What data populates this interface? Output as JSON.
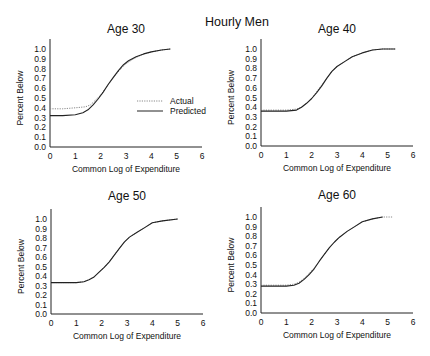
{
  "figure": {
    "suptitle": "Hourly Men",
    "legend": {
      "actual_label": "Actual",
      "predicted_label": "Predicted"
    }
  },
  "chart_data": [
    {
      "type": "line",
      "title": "Age 30",
      "xlabel": "Common Log of Expenditure",
      "ylabel": "Percent Below",
      "xlim": [
        0,
        6
      ],
      "ylim": [
        0,
        1.0
      ],
      "xticks": [
        "0",
        "1",
        "2",
        "3",
        "4",
        "5",
        "6"
      ],
      "yticks": [
        "0.0",
        "0.1",
        "0.2",
        "0.3",
        "0.4",
        "0.5",
        "0.6",
        "0.7",
        "0.8",
        "0.9",
        "1.0"
      ],
      "grid": false,
      "legend_position": "inside right-middle",
      "series": [
        {
          "name": "Actual",
          "style": "dotted",
          "x": [
            0,
            0.5,
            1.0,
            1.4,
            1.6,
            1.8,
            2.0,
            2.2,
            2.4,
            2.6,
            2.8,
            3.0,
            3.3,
            3.6,
            4.0,
            4.4,
            4.75
          ],
          "y": [
            0.39,
            0.39,
            0.4,
            0.41,
            0.43,
            0.48,
            0.53,
            0.6,
            0.67,
            0.74,
            0.8,
            0.85,
            0.9,
            0.94,
            0.97,
            0.99,
            1.0
          ]
        },
        {
          "name": "Predicted",
          "style": "solid",
          "x": [
            0,
            0.5,
            1.0,
            1.3,
            1.5,
            1.7,
            1.9,
            2.1,
            2.3,
            2.5,
            2.7,
            2.9,
            3.1,
            3.4,
            3.7,
            4.0,
            4.4,
            4.75
          ],
          "y": [
            0.32,
            0.32,
            0.33,
            0.35,
            0.38,
            0.43,
            0.49,
            0.56,
            0.64,
            0.71,
            0.78,
            0.84,
            0.88,
            0.92,
            0.95,
            0.97,
            0.99,
            1.0
          ]
        }
      ]
    },
    {
      "type": "line",
      "title": "Age 40",
      "xlabel": "Common Log of Expenditure",
      "ylabel": "Percent Below",
      "xlim": [
        0,
        6
      ],
      "ylim": [
        0,
        1.0
      ],
      "xticks": [
        "0",
        "1",
        "2",
        "3",
        "4",
        "5",
        "6"
      ],
      "yticks": [
        "0.0",
        "0.1",
        "0.2",
        "0.3",
        "0.4",
        "0.5",
        "0.6",
        "0.7",
        "0.8",
        "0.9",
        "1.0"
      ],
      "grid": false,
      "series": [
        {
          "name": "Actual",
          "style": "dotted",
          "x": [
            0,
            0.5,
            1.0,
            1.4,
            1.6,
            1.8,
            2.0,
            2.2,
            2.4,
            2.6,
            2.8,
            3.0,
            3.3,
            3.6,
            4.0,
            4.4,
            4.8,
            5.3
          ],
          "y": [
            0.37,
            0.37,
            0.37,
            0.38,
            0.4,
            0.44,
            0.49,
            0.56,
            0.63,
            0.7,
            0.77,
            0.82,
            0.87,
            0.92,
            0.96,
            0.99,
            1.0,
            1.0
          ]
        },
        {
          "name": "Predicted",
          "style": "solid",
          "x": [
            0,
            0.5,
            1.0,
            1.4,
            1.6,
            1.8,
            2.0,
            2.2,
            2.4,
            2.6,
            2.8,
            3.0,
            3.3,
            3.6,
            4.0,
            4.4,
            4.8,
            5.3
          ],
          "y": [
            0.36,
            0.36,
            0.36,
            0.37,
            0.4,
            0.44,
            0.49,
            0.55,
            0.62,
            0.7,
            0.77,
            0.82,
            0.87,
            0.92,
            0.96,
            0.99,
            1.0,
            1.0
          ]
        }
      ]
    },
    {
      "type": "line",
      "title": "Age 50",
      "xlabel": "Common Log of Expenditure",
      "ylabel": "Percent Below",
      "xlim": [
        0,
        6
      ],
      "ylim": [
        0,
        1.0
      ],
      "xticks": [
        "0",
        "1",
        "2",
        "3",
        "4",
        "5",
        "6"
      ],
      "yticks": [
        "0.0",
        "0.1",
        "0.2",
        "0.3",
        "0.4",
        "0.5",
        "0.6",
        "0.7",
        "0.8",
        "0.9",
        "1.0"
      ],
      "grid": false,
      "series": [
        {
          "name": "Actual",
          "style": "dotted",
          "x": [
            0,
            0.5,
            1.0,
            1.3,
            1.5,
            1.7,
            1.9,
            2.1,
            2.3,
            2.5,
            2.7,
            2.9,
            3.1,
            3.4,
            3.7,
            4.0,
            4.4,
            5.0
          ],
          "y": [
            0.33,
            0.33,
            0.33,
            0.34,
            0.36,
            0.39,
            0.44,
            0.49,
            0.55,
            0.62,
            0.69,
            0.76,
            0.81,
            0.86,
            0.91,
            0.96,
            0.98,
            1.0
          ]
        },
        {
          "name": "Predicted",
          "style": "solid",
          "x": [
            0,
            0.5,
            1.0,
            1.3,
            1.5,
            1.7,
            1.9,
            2.1,
            2.3,
            2.5,
            2.7,
            2.9,
            3.1,
            3.4,
            3.7,
            4.0,
            4.4,
            5.0
          ],
          "y": [
            0.33,
            0.33,
            0.33,
            0.34,
            0.36,
            0.39,
            0.44,
            0.49,
            0.55,
            0.62,
            0.69,
            0.76,
            0.81,
            0.86,
            0.91,
            0.96,
            0.98,
            1.0
          ]
        }
      ]
    },
    {
      "type": "line",
      "title": "Age 60",
      "xlabel": "Common Log of Expenditure",
      "ylabel": "Percent Below",
      "xlim": [
        0,
        6
      ],
      "ylim": [
        0,
        1.0
      ],
      "xticks": [
        "0",
        "1",
        "2",
        "3",
        "4",
        "5",
        "6"
      ],
      "yticks": [
        "0.0",
        "0.1",
        "0.2",
        "0.3",
        "0.4",
        "0.5",
        "0.6",
        "0.7",
        "0.8",
        "0.9",
        "1.0"
      ],
      "grid": false,
      "series": [
        {
          "name": "Actual",
          "style": "dotted",
          "x": [
            0,
            0.5,
            1.0,
            1.3,
            1.5,
            1.7,
            1.9,
            2.1,
            2.3,
            2.5,
            2.7,
            2.9,
            3.1,
            3.4,
            3.7,
            4.0,
            4.4,
            4.8,
            5.2
          ],
          "y": [
            0.29,
            0.29,
            0.29,
            0.3,
            0.32,
            0.36,
            0.41,
            0.47,
            0.54,
            0.61,
            0.68,
            0.74,
            0.79,
            0.85,
            0.9,
            0.95,
            0.98,
            1.0,
            1.0
          ]
        },
        {
          "name": "Predicted",
          "style": "solid",
          "x": [
            0,
            0.5,
            1.0,
            1.3,
            1.5,
            1.7,
            1.9,
            2.1,
            2.3,
            2.5,
            2.7,
            2.9,
            3.1,
            3.4,
            3.7,
            4.0,
            4.4,
            4.8
          ],
          "y": [
            0.28,
            0.28,
            0.28,
            0.29,
            0.31,
            0.35,
            0.4,
            0.46,
            0.54,
            0.61,
            0.68,
            0.74,
            0.79,
            0.85,
            0.9,
            0.95,
            0.98,
            1.0
          ]
        }
      ]
    }
  ],
  "layout": {
    "panels": [
      {
        "x0": 50,
        "x6": 202,
        "y0": 147,
        "y1": 49,
        "title_y": 33
      },
      {
        "x0": 261,
        "x6": 413,
        "y0": 146,
        "y1": 49,
        "title_y": 33
      },
      {
        "x0": 51,
        "x6": 203,
        "y0": 314,
        "y1": 219,
        "title_y": 200
      },
      {
        "x0": 261,
        "x6": 413,
        "y0": 313,
        "y1": 217,
        "title_y": 199
      }
    ],
    "colors": {
      "axis": "#222222",
      "actual": "#888888",
      "predicted": "#222222"
    }
  }
}
